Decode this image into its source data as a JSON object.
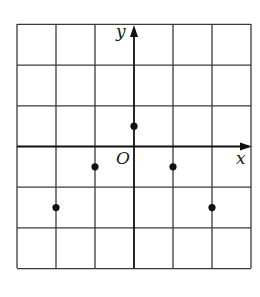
{
  "diagram": {
    "title": "",
    "grid": {
      "x_min": -3,
      "x_max": 3,
      "y_min": -3,
      "y_max": 3,
      "cell_px_x": 39,
      "cell_px_y": 40.7,
      "origin_px": [
        134,
        146.5
      ],
      "left_px": 17,
      "top_px": 24,
      "right_px": 251,
      "bottom_px": 268
    },
    "axes": {
      "x_label": "x",
      "y_label": "y",
      "origin_label": "O"
    },
    "points": [
      {
        "x": 0,
        "y": 0.5
      },
      {
        "x": -1,
        "y": -0.5
      },
      {
        "x": 1,
        "y": -0.5
      },
      {
        "x": -2,
        "y": -1.5
      },
      {
        "x": 2,
        "y": -1.5
      }
    ],
    "colors": {
      "grid": "#3a3a3a",
      "axis": "#111111",
      "point": "#111111",
      "background": "#ffffff"
    }
  },
  "chart_data": {
    "type": "scatter",
    "title": "",
    "xlabel": "x",
    "ylabel": "y",
    "origin_label": "O",
    "x": [
      0,
      -1,
      1,
      -2,
      2
    ],
    "y": [
      0.5,
      -0.5,
      -0.5,
      -1.5,
      -1.5
    ],
    "xlim": [
      -3,
      3
    ],
    "ylim": [
      -3,
      3
    ],
    "grid": true,
    "tick_labels": false,
    "legend": null
  }
}
